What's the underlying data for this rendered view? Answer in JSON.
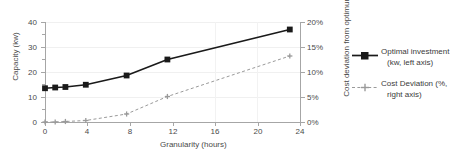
{
  "chart_data": {
    "type": "line",
    "title": "",
    "xlabel": "Granularity (hours)",
    "ylabel": "Capacity (kw)",
    "y2label": "Cost deviation from optimum (%)",
    "x": [
      0,
      1,
      2,
      4,
      8,
      12,
      24
    ],
    "xlim": [
      0,
      25
    ],
    "ylim": [
      0,
      40
    ],
    "y2lim": [
      0,
      20
    ],
    "xticks": [
      "0",
      "4",
      "8",
      "12",
      "16",
      "20",
      "24"
    ],
    "xtick_values": [
      0,
      4,
      8,
      12,
      16,
      20,
      24
    ],
    "yticks": [
      "0",
      "10",
      "20",
      "30",
      "40"
    ],
    "ytick_values": [
      0,
      10,
      20,
      30,
      40
    ],
    "y2ticks": [
      "0%",
      "5%",
      "10%",
      "15%",
      "20%"
    ],
    "y2tick_values": [
      0,
      5,
      10,
      15,
      20
    ],
    "grid": "horizontal",
    "legend_position": "right",
    "series": [
      {
        "name": "Optimal investment (kw, left axis)",
        "legend_line1": "Optimal investment",
        "legend_line2": "(kw, left axis)",
        "axis": "left",
        "color": "#1a1a1a",
        "style": "solid",
        "marker": "square",
        "values": [
          13.5,
          13.8,
          14.0,
          14.9,
          18.6,
          25.0,
          37.0
        ]
      },
      {
        "name": "Cost Deviation (%, right axis)",
        "legend_line1": "Cost Deviation (%,",
        "legend_line2": "right axis)",
        "axis": "right",
        "color": "#9a9a9a",
        "style": "dashed",
        "marker": "cross",
        "values": [
          0.0,
          0.0,
          0.1,
          0.3,
          1.6,
          5.1,
          13.2
        ]
      }
    ]
  }
}
